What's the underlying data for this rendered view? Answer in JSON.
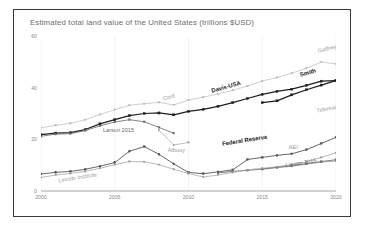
{
  "chart_data": {
    "type": "line",
    "title": "Estimated total land value of the United States (trillions $USD)",
    "xlabel": "",
    "ylabel": "",
    "xlim": [
      2000,
      2020
    ],
    "ylim": [
      0,
      60
    ],
    "yticks": [
      0,
      20,
      40,
      60
    ],
    "xticks": [
      2000,
      2005,
      2010,
      2015,
      2020
    ],
    "ytick_labels": [
      "0",
      "20",
      "40",
      "60"
    ],
    "xtick_labels": [
      "2000",
      "2005",
      "2010",
      "2015",
      "2020"
    ],
    "grid": "vertical-faint",
    "legend": "inline-series-labels",
    "x": [
      2000,
      2001,
      2002,
      2003,
      2004,
      2005,
      2006,
      2007,
      2008,
      2009,
      2010,
      2011,
      2012,
      2013,
      2014,
      2015,
      2016,
      2017,
      2018,
      2019,
      2020
    ],
    "series": [
      {
        "name": "Gaffney",
        "label": "Gaffney",
        "color": "#b9b9b9",
        "style": "light",
        "values": [
          24.5,
          25.4,
          26.2,
          27.6,
          29.6,
          31.5,
          33.2,
          33.8,
          34.3,
          33.3,
          35.2,
          36.3,
          37.6,
          39.0,
          40.6,
          42.6,
          43.9,
          45.6,
          47.5,
          49.9,
          49.2
        ]
      },
      {
        "name": "Cord",
        "label": "Cord",
        "color": "#c2c2c2",
        "style": "light",
        "values": [
          null,
          null,
          null,
          null,
          null,
          null,
          null,
          null,
          null,
          null,
          null,
          null,
          null,
          null,
          null,
          null,
          null,
          null,
          null,
          null,
          null
        ]
      },
      {
        "name": "Davis-USA",
        "label": "Davis-USA",
        "color": "#1f1f1f",
        "style": "bold",
        "values": [
          21.8,
          22.4,
          22.6,
          23.8,
          26.0,
          27.6,
          29.2,
          30.0,
          30.2,
          29.5,
          30.8,
          31.6,
          32.8,
          34.2,
          35.8,
          37.4,
          38.6,
          39.4,
          40.9,
          42.5,
          42.7
        ]
      },
      {
        "name": "Smith",
        "label": "Smith",
        "color": "#1f1f1f",
        "style": "bold",
        "values": [
          null,
          null,
          null,
          null,
          null,
          null,
          null,
          null,
          null,
          null,
          null,
          null,
          null,
          null,
          null,
          34.2,
          34.9,
          37.2,
          39.2,
          41.0,
          42.7
        ]
      },
      {
        "name": "Larson 2015 (upper)",
        "label": "Larson 2015",
        "color": "#6f6f6f",
        "style": "mid",
        "values": [
          21.2,
          22.0,
          22.2,
          23.4,
          25.2,
          26.7,
          27.6,
          26.8,
          24.6,
          22.4,
          null,
          null,
          null,
          null,
          null,
          null,
          null,
          null,
          null,
          null,
          null
        ]
      },
      {
        "name": "Albouy",
        "label": "Albouy",
        "color": "#a4a4a4",
        "style": "light",
        "values": [
          null,
          null,
          null,
          null,
          null,
          null,
          null,
          null,
          23.5,
          17.8,
          18.8,
          null,
          null,
          null,
          null,
          null,
          null,
          null,
          null,
          null,
          null
        ]
      },
      {
        "name": "Tideman",
        "label": "Tideman",
        "color": "#b4b4b4",
        "style": "light",
        "values": [
          null,
          null,
          null,
          null,
          null,
          null,
          null,
          null,
          null,
          null,
          null,
          null,
          null,
          null,
          null,
          null,
          null,
          null,
          null,
          null,
          null
        ]
      },
      {
        "name": "Federal Reserve",
        "label": "Federal Reserve",
        "color": "#4d4d4d",
        "style": "mid",
        "values": [
          6.6,
          7.2,
          7.6,
          8.4,
          9.6,
          11.0,
          15.4,
          17.2,
          14.2,
          10.5,
          7.2,
          6.7,
          7.4,
          8.2,
          12.2,
          13.0,
          13.8,
          14.4,
          16.0,
          18.4,
          20.8
        ]
      },
      {
        "name": "AEI",
        "label": "AEI",
        "color": "#8e8e8e",
        "style": "light",
        "values": [
          null,
          null,
          null,
          null,
          null,
          null,
          null,
          null,
          null,
          null,
          null,
          null,
          null,
          null,
          null,
          8.4,
          9.0,
          9.6,
          10.4,
          11.2,
          11.6
        ]
      },
      {
        "name": "Larson 2015 (lower)",
        "label": "Larson 2015",
        "color": "#6b6b6b",
        "style": "mid",
        "values": [
          null,
          null,
          null,
          null,
          null,
          null,
          null,
          null,
          null,
          null,
          null,
          null,
          7.0,
          7.6,
          8.0,
          8.5,
          9.2,
          9.8,
          10.6,
          11.4,
          12.1
        ]
      },
      {
        "name": "Lincoln Institute",
        "label": "Lincoln Institute",
        "color": "#9c9c9c",
        "style": "light",
        "values": [
          5.2,
          6.2,
          6.8,
          7.6,
          8.8,
          10.2,
          11.4,
          11.3,
          10.2,
          8.4,
          6.8,
          5.4,
          6.2,
          7.2,
          8.2,
          8.8,
          9.4,
          10.2,
          11.3,
          13.0,
          14.8
        ]
      },
      {
        "name": "extra-right",
        "label": "extra",
        "color": "#b0b0b0",
        "style": "light",
        "values": [
          null,
          null,
          null,
          null,
          null,
          null,
          null,
          null,
          null,
          null,
          null,
          null,
          null,
          null,
          null,
          null,
          null,
          null,
          null,
          null,
          null
        ]
      }
    ],
    "annotations": [
      {
        "text": "Gaffney",
        "x": 2018.8,
        "y": 53.5,
        "style": "light",
        "rotate": -14
      },
      {
        "text": "Cord",
        "x": 2008.3,
        "y": 35.0,
        "style": "light",
        "rotate": -16
      },
      {
        "text": "Davis-USA",
        "x": 2011.6,
        "y": 38.0,
        "style": "dark",
        "rotate": -16
      },
      {
        "text": "Smith",
        "x": 2017.6,
        "y": 44.2,
        "style": "dark",
        "rotate": -16
      },
      {
        "text": "Tideman",
        "x": 2018.7,
        "y": 30.3,
        "style": "light",
        "rotate": -11
      },
      {
        "text": "Larson 2015",
        "x": 2004.2,
        "y": 22.8,
        "style": "mid",
        "rotate": 0
      },
      {
        "text": "Albouy",
        "x": 2008.6,
        "y": 15.1,
        "style": "light",
        "rotate": 0
      },
      {
        "text": "Federal Reserve",
        "x": 2012.3,
        "y": 17.5,
        "style": "dark",
        "rotate": -9
      },
      {
        "text": "AEI",
        "x": 2016.8,
        "y": 16.3,
        "style": "light",
        "rotate": 0
      },
      {
        "text": "Larson 2015",
        "x": 2016.6,
        "y": 9.2,
        "style": "mid",
        "rotate": -9
      },
      {
        "text": "Lincoln Institute",
        "x": 2001.2,
        "y": 3.3,
        "style": "light",
        "rotate": -9
      }
    ]
  }
}
